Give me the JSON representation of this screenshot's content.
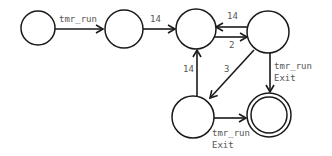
{
  "diagram": {
    "type": "state-machine",
    "states": [
      {
        "id": "s1",
        "cx": 38,
        "cy": 28,
        "r": 17,
        "accepting": false
      },
      {
        "id": "s2",
        "cx": 124,
        "cy": 29,
        "r": 19,
        "accepting": false
      },
      {
        "id": "s3",
        "cx": 196,
        "cy": 29,
        "r": 20,
        "accepting": false
      },
      {
        "id": "s4",
        "cx": 268,
        "cy": 32,
        "r": 21,
        "accepting": false
      },
      {
        "id": "s5",
        "cx": 193,
        "cy": 117,
        "r": 21,
        "accepting": false
      },
      {
        "id": "s6",
        "cx": 269,
        "cy": 115,
        "r": 22,
        "accepting": true
      }
    ],
    "transitions": [
      {
        "from": "s1",
        "to": "s2",
        "label": "tmr_run"
      },
      {
        "from": "s2",
        "to": "s3",
        "label": "14"
      },
      {
        "from": "s4",
        "to": "s3",
        "label": "14"
      },
      {
        "from": "s3",
        "to": "s4",
        "label": "2"
      },
      {
        "from": "s5",
        "to": "s3",
        "label": "14"
      },
      {
        "from": "s4",
        "to": "s5",
        "label": "3"
      },
      {
        "from": "s4",
        "to": "s6",
        "label_line1": "tmr_run",
        "label_line2": "Exit"
      },
      {
        "from": "s5",
        "to": "s6",
        "label_line1": "tmr_run",
        "label_line2": "Exit"
      }
    ]
  },
  "colors": {
    "stroke": "#1a1a1a",
    "label": "#555555",
    "background": "#ffffff"
  }
}
